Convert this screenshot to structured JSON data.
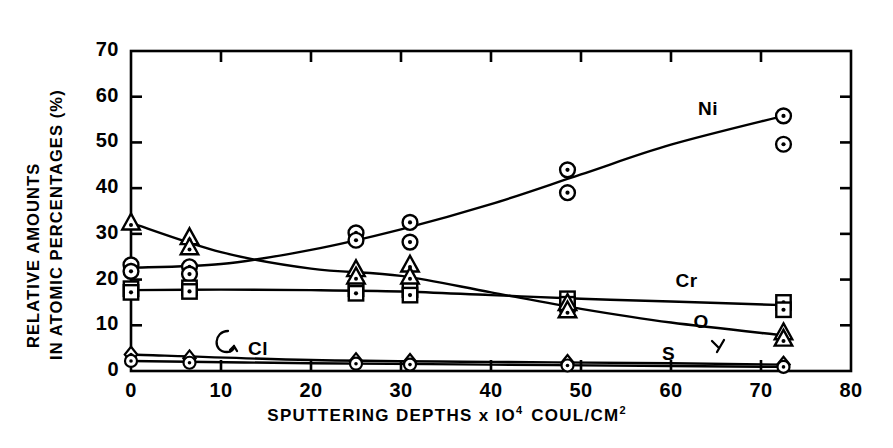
{
  "chart_data": {
    "type": "line",
    "title": "",
    "xlabel": "SPUTTERING DEPTHS x 10 4 COUL/CM 2",
    "xlabel_parts": {
      "main": "SPUTTERING  DEPTHS x IO",
      "exp1": "4",
      "mid": "COUL/CM",
      "exp2": "2"
    },
    "ylabel": "RELATIVE AMOUNTS IN ATOMIC PERCENTAGES (%)",
    "ylabel_line1": "RELATIVE  AMOUNTS",
    "ylabel_line2": "IN ATOMIC  PERCENTAGES (%)",
    "xlim": [
      0,
      80
    ],
    "ylim": [
      0,
      70
    ],
    "xticks": [
      "0",
      "10",
      "20",
      "30",
      "40",
      "50",
      "60",
      "70",
      "80"
    ],
    "yticks": [
      "0",
      "10",
      "20",
      "30",
      "40",
      "50",
      "60",
      "70"
    ],
    "grid": false,
    "legend": "inline-annotations",
    "series": [
      {
        "name": "Ni",
        "marker": "circle-dot",
        "label_x": 63,
        "label_y": 57,
        "points": [
          {
            "x": 0.0,
            "y": 23.2
          },
          {
            "x": 0.0,
            "y": 21.8
          },
          {
            "x": 6.5,
            "y": 22.8
          },
          {
            "x": 6.5,
            "y": 21.2
          },
          {
            "x": 25.0,
            "y": 30.2
          },
          {
            "x": 25.0,
            "y": 28.6
          },
          {
            "x": 31.0,
            "y": 32.5
          },
          {
            "x": 31.0,
            "y": 28.2
          },
          {
            "x": 48.5,
            "y": 44.0
          },
          {
            "x": 48.5,
            "y": 39.0
          },
          {
            "x": 72.5,
            "y": 55.8
          },
          {
            "x": 72.5,
            "y": 49.6
          }
        ],
        "curve": [
          {
            "x": 0,
            "y": 22.6
          },
          {
            "x": 10,
            "y": 23.4
          },
          {
            "x": 20,
            "y": 26.5
          },
          {
            "x": 30,
            "y": 31.0
          },
          {
            "x": 40,
            "y": 36.5
          },
          {
            "x": 50,
            "y": 43.0
          },
          {
            "x": 60,
            "y": 49.5
          },
          {
            "x": 72.5,
            "y": 55.8
          }
        ]
      },
      {
        "name": "Cr",
        "marker": "square-dot",
        "label_x": 60.5,
        "label_y": 19.5,
        "points": [
          {
            "x": 0.0,
            "y": 18.0
          },
          {
            "x": 0.0,
            "y": 17.2
          },
          {
            "x": 6.5,
            "y": 18.2
          },
          {
            "x": 6.5,
            "y": 17.4
          },
          {
            "x": 25.0,
            "y": 18.0
          },
          {
            "x": 25.0,
            "y": 17.0
          },
          {
            "x": 31.0,
            "y": 17.8
          },
          {
            "x": 31.0,
            "y": 16.6
          },
          {
            "x": 48.5,
            "y": 15.8
          },
          {
            "x": 48.5,
            "y": 14.6
          },
          {
            "x": 72.5,
            "y": 15.0
          },
          {
            "x": 72.5,
            "y": 13.4
          }
        ],
        "curve": [
          {
            "x": 0,
            "y": 17.7
          },
          {
            "x": 10,
            "y": 17.8
          },
          {
            "x": 20,
            "y": 17.7
          },
          {
            "x": 30,
            "y": 17.4
          },
          {
            "x": 40,
            "y": 16.6
          },
          {
            "x": 50,
            "y": 15.8
          },
          {
            "x": 60,
            "y": 15.2
          },
          {
            "x": 72.5,
            "y": 14.4
          }
        ]
      },
      {
        "name": "O",
        "marker": "triangle-dot",
        "label_x": 62.5,
        "label_y": 10.5,
        "points": [
          {
            "x": 0.0,
            "y": 32.4
          },
          {
            "x": 6.5,
            "y": 29.2
          },
          {
            "x": 6.5,
            "y": 27.0
          },
          {
            "x": 25.0,
            "y": 22.2
          },
          {
            "x": 25.0,
            "y": 20.6
          },
          {
            "x": 31.0,
            "y": 23.2
          },
          {
            "x": 31.0,
            "y": 20.6
          },
          {
            "x": 48.5,
            "y": 14.8
          },
          {
            "x": 48.5,
            "y": 13.2
          },
          {
            "x": 72.5,
            "y": 8.4
          },
          {
            "x": 72.5,
            "y": 7.0
          }
        ],
        "curve": [
          {
            "x": 0,
            "y": 32.4
          },
          {
            "x": 10,
            "y": 26.0
          },
          {
            "x": 20,
            "y": 22.4
          },
          {
            "x": 30,
            "y": 20.8
          },
          {
            "x": 40,
            "y": 17.2
          },
          {
            "x": 50,
            "y": 13.6
          },
          {
            "x": 60,
            "y": 10.6
          },
          {
            "x": 72.5,
            "y": 7.8
          }
        ]
      },
      {
        "name": "S",
        "marker": "diamond-dot",
        "label_x": 59.0,
        "label_y": 3.4,
        "points": [
          {
            "x": 0.0,
            "y": 3.6
          },
          {
            "x": 6.5,
            "y": 2.8
          },
          {
            "x": 25.0,
            "y": 2.2
          },
          {
            "x": 31.0,
            "y": 2.0
          },
          {
            "x": 48.5,
            "y": 1.8
          },
          {
            "x": 72.5,
            "y": 1.4
          }
        ],
        "curve": [
          {
            "x": 0,
            "y": 3.6
          },
          {
            "x": 20,
            "y": 2.4
          },
          {
            "x": 40,
            "y": 2.0
          },
          {
            "x": 60,
            "y": 1.7
          },
          {
            "x": 72.5,
            "y": 1.4
          }
        ]
      },
      {
        "name": "Cl",
        "marker": "circle-small",
        "label_x": 13.0,
        "label_y": 4.6,
        "points": [
          {
            "x": 0.0,
            "y": 2.2
          },
          {
            "x": 6.5,
            "y": 1.8
          },
          {
            "x": 25.0,
            "y": 1.6
          },
          {
            "x": 31.0,
            "y": 1.4
          },
          {
            "x": 48.5,
            "y": 1.2
          },
          {
            "x": 72.5,
            "y": 0.9
          }
        ],
        "curve": [
          {
            "x": 0,
            "y": 2.2
          },
          {
            "x": 20,
            "y": 1.7
          },
          {
            "x": 40,
            "y": 1.4
          },
          {
            "x": 60,
            "y": 1.1
          },
          {
            "x": 72.5,
            "y": 0.9
          }
        ]
      }
    ],
    "annotations": [
      {
        "text": "Ni",
        "series": "Ni"
      },
      {
        "text": "Cr",
        "series": "Cr"
      },
      {
        "text": "O",
        "series": "O"
      },
      {
        "text": "S",
        "series": "S"
      },
      {
        "text": "Cl",
        "series": "Cl"
      }
    ],
    "colors": {
      "ink": "#000000",
      "background": "#ffffff"
    }
  }
}
